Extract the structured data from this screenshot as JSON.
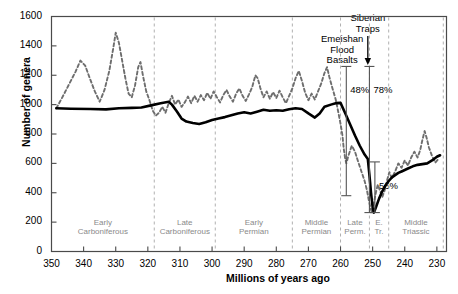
{
  "axes": {
    "ylabel": "Number of genera",
    "xlabel": "Millions of years ago",
    "yticks": [
      0,
      200,
      400,
      600,
      800,
      1000,
      1200,
      1400,
      1600
    ],
    "xticks": [
      350,
      340,
      330,
      320,
      310,
      300,
      290,
      280,
      270,
      260,
      250,
      240,
      230
    ],
    "ylim": [
      0,
      1600
    ],
    "xlim": [
      350,
      227
    ]
  },
  "periods": [
    {
      "label_line1": "Early",
      "label_line2": "Carboniferous",
      "start": 350,
      "end": 318
    },
    {
      "label_line1": "Late",
      "label_line2": "Carboniferous",
      "start": 318,
      "end": 299
    },
    {
      "label_line1": "Early",
      "label_line2": "Permian",
      "start": 299,
      "end": 275
    },
    {
      "label_line1": "Middle",
      "label_line2": "Permian",
      "start": 275,
      "end": 260
    },
    {
      "label_line1": "Late",
      "label_line2": "Perm.",
      "start": 260,
      "end": 251
    },
    {
      "label_line1": "E.",
      "label_line2": "Tr.",
      "start": 251,
      "end": 245
    },
    {
      "label_line1": "Middle",
      "label_line2": "Triassic",
      "start": 245,
      "end": 228
    }
  ],
  "annotations": [
    {
      "name": "emeishan-flood-basalts",
      "lines": [
        "Emeishan",
        "Flood",
        "Basalts"
      ],
      "x": 259.5
    },
    {
      "name": "siberian-traps",
      "lines": [
        "Siberian",
        "Traps"
      ],
      "x": 251.5
    }
  ],
  "brackets": [
    {
      "name": "bracket-48",
      "label": "48%",
      "x": 258.2,
      "y_top": 1260,
      "y_bottom": 380
    },
    {
      "name": "bracket-78",
      "label": "78%",
      "x": 251.0,
      "y_top": 1260,
      "y_bottom": 265
    },
    {
      "name": "bracket-56",
      "label": "56%",
      "x": 249.3,
      "y_top": 610,
      "y_bottom": 265
    }
  ],
  "colors": {
    "raw_series": "#6e6e6e",
    "subsampled_series": "#000000",
    "frame": "#4a4a4a",
    "period_text": "#8a8a8a",
    "divider": "#b0b0b0"
  },
  "chart_data": {
    "type": "line",
    "title": "",
    "xlabel": "Millions of years ago",
    "ylabel": "Number of genera",
    "xlim": [
      350,
      227
    ],
    "ylim": [
      0,
      1600
    ],
    "x_reversed": true,
    "grid": false,
    "legend": "none",
    "series": [
      {
        "name": "Raw genus counts (dashed)",
        "style": "dashed",
        "color": "#6e6e6e",
        "points": [
          [
            348.5,
            975
          ],
          [
            346.5,
            1055
          ],
          [
            344.5,
            1140
          ],
          [
            342.5,
            1225
          ],
          [
            341.0,
            1300
          ],
          [
            339.5,
            1265
          ],
          [
            338.0,
            1175
          ],
          [
            336.5,
            1090
          ],
          [
            335.0,
            1020
          ],
          [
            333.5,
            1100
          ],
          [
            332.0,
            1230
          ],
          [
            330.8,
            1380
          ],
          [
            330.0,
            1490
          ],
          [
            329.0,
            1420
          ],
          [
            328.0,
            1300
          ],
          [
            327.0,
            1180
          ],
          [
            326.0,
            1075
          ],
          [
            325.0,
            1050
          ],
          [
            324.0,
            1130
          ],
          [
            323.0,
            1255
          ],
          [
            322.3,
            1290
          ],
          [
            321.5,
            1195
          ],
          [
            320.5,
            1090
          ],
          [
            319.5,
            1030
          ],
          [
            318.5,
            960
          ],
          [
            317.5,
            925
          ],
          [
            316.5,
            945
          ],
          [
            315.5,
            985
          ],
          [
            314.5,
            945
          ],
          [
            313.5,
            1010
          ],
          [
            312.5,
            1060
          ],
          [
            311.5,
            1000
          ],
          [
            310.5,
            1035
          ],
          [
            309.5,
            985
          ],
          [
            308.5,
            1015
          ],
          [
            307.5,
            1055
          ],
          [
            306.5,
            1010
          ],
          [
            305.5,
            1060
          ],
          [
            304.5,
            1020
          ],
          [
            303.5,
            1065
          ],
          [
            302.5,
            1030
          ],
          [
            301.5,
            1080
          ],
          [
            300.5,
            1040
          ],
          [
            299.5,
            1090
          ],
          [
            298.5,
            1050
          ],
          [
            297.5,
            1015
          ],
          [
            296.5,
            1065
          ],
          [
            295.5,
            1100
          ],
          [
            294.5,
            1055
          ],
          [
            293.5,
            1020
          ],
          [
            292.5,
            1075
          ],
          [
            291.5,
            1110
          ],
          [
            290.5,
            1060
          ],
          [
            289.5,
            1025
          ],
          [
            288.5,
            1070
          ],
          [
            287.5,
            1120
          ],
          [
            286.5,
            1200
          ],
          [
            285.8,
            1180
          ],
          [
            285.0,
            1115
          ],
          [
            284.0,
            1050
          ],
          [
            283.0,
            1090
          ],
          [
            282.0,
            1040
          ],
          [
            281.0,
            1085
          ],
          [
            280.0,
            1045
          ],
          [
            279.0,
            1095
          ],
          [
            278.0,
            1050
          ],
          [
            277.0,
            1010
          ],
          [
            276.0,
            1060
          ],
          [
            275.0,
            1110
          ],
          [
            274.0,
            1180
          ],
          [
            273.0,
            1230
          ],
          [
            272.0,
            1160
          ],
          [
            271.0,
            1080
          ],
          [
            270.0,
            1030
          ],
          [
            269.0,
            1075
          ],
          [
            268.0,
            1035
          ],
          [
            267.0,
            1090
          ],
          [
            266.0,
            1145
          ],
          [
            265.0,
            1215
          ],
          [
            264.2,
            1255
          ],
          [
            263.5,
            1190
          ],
          [
            262.5,
            1110
          ],
          [
            261.5,
            1035
          ],
          [
            260.8,
            960
          ],
          [
            260.0,
            870
          ],
          [
            259.4,
            790
          ],
          [
            259.0,
            700
          ],
          [
            258.6,
            640
          ],
          [
            258.2,
            600
          ],
          [
            257.5,
            655
          ],
          [
            256.5,
            720
          ],
          [
            255.5,
            680
          ],
          [
            254.5,
            610
          ],
          [
            253.5,
            545
          ],
          [
            252.5,
            480
          ],
          [
            251.8,
            420
          ],
          [
            251.2,
            350
          ],
          [
            250.6,
            290
          ],
          [
            250.2,
            265
          ],
          [
            249.6,
            330
          ],
          [
            249.0,
            400
          ],
          [
            248.4,
            455
          ],
          [
            247.8,
            420
          ],
          [
            247.0,
            370
          ],
          [
            246.2,
            420
          ],
          [
            245.5,
            485
          ],
          [
            244.8,
            540
          ],
          [
            244.0,
            500
          ],
          [
            243.0,
            545
          ],
          [
            242.0,
            600
          ],
          [
            241.0,
            570
          ],
          [
            240.0,
            620
          ],
          [
            239.0,
            585
          ],
          [
            238.0,
            640
          ],
          [
            237.0,
            680
          ],
          [
            236.0,
            640
          ],
          [
            235.2,
            690
          ],
          [
            234.5,
            760
          ],
          [
            233.8,
            820
          ],
          [
            233.2,
            775
          ],
          [
            232.5,
            710
          ],
          [
            231.5,
            650
          ],
          [
            230.5,
            605
          ],
          [
            229.5,
            630
          ]
        ]
      },
      {
        "name": "Subsampled diversity (solid)",
        "style": "solid",
        "color": "#000000",
        "points": [
          [
            348.5,
            975
          ],
          [
            344.0,
            972
          ],
          [
            338.0,
            970
          ],
          [
            333.0,
            968
          ],
          [
            329.0,
            975
          ],
          [
            325.0,
            978
          ],
          [
            322.0,
            980
          ],
          [
            319.0,
            995
          ],
          [
            316.0,
            1010
          ],
          [
            313.5,
            1020
          ],
          [
            312.5,
            1000
          ],
          [
            311.0,
            955
          ],
          [
            309.5,
            905
          ],
          [
            308.0,
            885
          ],
          [
            306.0,
            875
          ],
          [
            304.0,
            868
          ],
          [
            302.0,
            880
          ],
          [
            300.0,
            895
          ],
          [
            298.0,
            905
          ],
          [
            296.0,
            915
          ],
          [
            294.0,
            928
          ],
          [
            292.0,
            940
          ],
          [
            290.0,
            948
          ],
          [
            288.0,
            940
          ],
          [
            286.0,
            952
          ],
          [
            284.0,
            965
          ],
          [
            282.0,
            958
          ],
          [
            280.0,
            962
          ],
          [
            278.0,
            958
          ],
          [
            276.0,
            968
          ],
          [
            274.0,
            975
          ],
          [
            272.0,
            970
          ],
          [
            270.0,
            940
          ],
          [
            268.0,
            912
          ],
          [
            266.5,
            940
          ],
          [
            265.0,
            985
          ],
          [
            263.0,
            1000
          ],
          [
            261.5,
            1010
          ],
          [
            260.0,
            1012
          ],
          [
            258.5,
            940
          ],
          [
            257.0,
            865
          ],
          [
            255.5,
            790
          ],
          [
            254.0,
            720
          ],
          [
            252.5,
            660
          ],
          [
            251.5,
            630
          ],
          [
            251.0,
            520
          ],
          [
            250.5,
            400
          ],
          [
            250.0,
            300
          ],
          [
            249.6,
            265
          ],
          [
            249.0,
            300
          ],
          [
            248.0,
            360
          ],
          [
            247.0,
            410
          ],
          [
            246.0,
            450
          ],
          [
            245.0,
            480
          ],
          [
            244.0,
            505
          ],
          [
            243.0,
            520
          ],
          [
            242.0,
            535
          ],
          [
            241.0,
            545
          ],
          [
            240.0,
            555
          ],
          [
            239.0,
            565
          ],
          [
            237.5,
            580
          ],
          [
            236.0,
            590
          ],
          [
            234.5,
            595
          ],
          [
            233.0,
            600
          ],
          [
            231.5,
            620
          ],
          [
            230.0,
            645
          ],
          [
            229.0,
            655
          ]
        ]
      }
    ],
    "annotations": [
      {
        "text": "Emeishan Flood Basalts",
        "x": 259.5,
        "type": "event-label"
      },
      {
        "text": "Siberian Traps",
        "x": 251.5,
        "type": "event-label-with-arrow"
      },
      {
        "text": "48%",
        "x": 258.2,
        "type": "extinction-magnitude"
      },
      {
        "text": "78%",
        "x": 251.0,
        "type": "extinction-magnitude"
      },
      {
        "text": "56%",
        "x": 249.3,
        "type": "extinction-magnitude"
      }
    ]
  }
}
